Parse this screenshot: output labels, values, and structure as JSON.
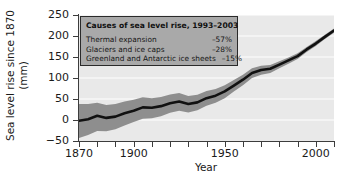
{
  "chart_data": {
    "type": "line",
    "title": "",
    "xlabel": "Year",
    "ylabel": "Sea level rise since 1870 (mm)",
    "ylabel_line1": "Sea level rise since 1870",
    "ylabel_line2": "(mm)",
    "xlim": [
      1870,
      2010
    ],
    "ylim": [
      -50,
      250
    ],
    "xticks": [
      1870,
      1880,
      1890,
      1900,
      1910,
      1920,
      1930,
      1940,
      1950,
      1960,
      1970,
      1980,
      1990,
      2000,
      2010
    ],
    "xtick_labels": [
      "1870",
      "",
      "",
      "1900",
      "",
      "",
      "",
      "",
      "1950",
      "",
      "",
      "",
      "",
      "2000",
      ""
    ],
    "yticks": [
      -50,
      0,
      50,
      100,
      150,
      200,
      250
    ],
    "ytick_labels": [
      "−50",
      "0",
      "50",
      "100",
      "150",
      "200",
      "250"
    ],
    "grid": "horizontal-white",
    "legend_position": "top-left-inside",
    "series": [
      {
        "name": "Global mean sea level rise",
        "color": "#111111",
        "x": [
          1870,
          1875,
          1880,
          1885,
          1890,
          1895,
          1900,
          1905,
          1910,
          1915,
          1920,
          1925,
          1930,
          1935,
          1940,
          1945,
          1950,
          1955,
          1960,
          1965,
          1970,
          1975,
          1980,
          1985,
          1990,
          1995,
          2000,
          2005,
          2010
        ],
        "values": [
          -2,
          2,
          10,
          5,
          8,
          16,
          22,
          30,
          29,
          33,
          40,
          44,
          38,
          42,
          52,
          58,
          68,
          82,
          96,
          112,
          119,
          122,
          132,
          142,
          152,
          168,
          182,
          198,
          213
        ]
      },
      {
        "name": "Uncertainty band",
        "color": "#8e8e8e",
        "x": [
          1870,
          1875,
          1880,
          1885,
          1890,
          1895,
          1900,
          1905,
          1910,
          1915,
          1920,
          1925,
          1930,
          1935,
          1940,
          1945,
          1950,
          1955,
          1960,
          1965,
          1970,
          1975,
          1980,
          1985,
          1990,
          1995,
          2000,
          2005,
          2010
        ],
        "upper": [
          38,
          38,
          41,
          36,
          38,
          44,
          48,
          54,
          52,
          55,
          61,
          64,
          57,
          60,
          69,
          74,
          83,
          95,
          108,
          123,
          129,
          131,
          140,
          149,
          159,
          174,
          188,
          203,
          218
        ],
        "lower": [
          -43,
          -36,
          -26,
          -27,
          -22,
          -13,
          -5,
          3,
          4,
          9,
          17,
          22,
          18,
          23,
          34,
          41,
          52,
          68,
          83,
          100,
          108,
          112,
          123,
          134,
          145,
          162,
          176,
          193,
          208
        ]
      }
    ]
  },
  "legend": {
    "title": "Causes of sea level rise, 1993–2003",
    "rows": [
      {
        "label": "Thermal expansion",
        "value": "–57%"
      },
      {
        "label": "Glaciers and ice caps",
        "value": "–28%"
      },
      {
        "label": "Greenland and Antarctic ice sheets",
        "value": "–15%"
      }
    ]
  }
}
